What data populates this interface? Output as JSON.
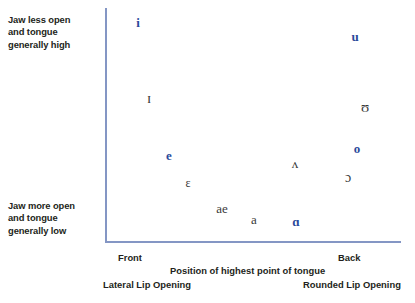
{
  "figure": {
    "accent_color": "#2b4a9b",
    "axis_color": "#8496c4",
    "symbol_color_secondary": "#3a3a3a"
  },
  "notes": {
    "top_left": {
      "line1": "Jaw less open",
      "line2": "and tongue",
      "line3": "generally high"
    },
    "bottom_left": {
      "line1": "Jaw more open",
      "line2": "and tongue",
      "line3": "generally low"
    }
  },
  "axis_labels": {
    "front": "Front",
    "back": "Back",
    "x_title": "Position of highest point of tongue",
    "lateral": "Lateral Lip Opening",
    "rounded": "Rounded Lip Opening"
  },
  "chart_data": {
    "type": "scatter",
    "title": "",
    "xlabel": "Position of highest point of tongue",
    "ylabel": "",
    "xlim": [
      0,
      1
    ],
    "ylim": [
      0,
      1
    ],
    "grid": false,
    "legend": "none",
    "x_tick_labels": [
      "Front",
      "Back"
    ],
    "y_axis_description_high": "Jaw less open and tongue generally high",
    "y_axis_description_low": "Jaw more open and tongue generally low",
    "points": [
      {
        "symbol": "i",
        "x": 0.112,
        "y": 0.94,
        "color": "#2b4a9b",
        "emphasis": "bold",
        "px": 138,
        "py": 22,
        "size": 13
      },
      {
        "symbol": "u",
        "x": 0.846,
        "y": 0.88,
        "color": "#2b4a9b",
        "emphasis": "bold",
        "px": 355,
        "py": 36,
        "size": 13
      },
      {
        "symbol": "ɪ",
        "x": 0.149,
        "y": 0.618,
        "color": "#3a3a3a",
        "emphasis": "normal",
        "px": 149,
        "py": 98,
        "size": 15
      },
      {
        "symbol": "ʊ",
        "x": 0.88,
        "y": 0.58,
        "color": "#3a3a3a",
        "emphasis": "normal",
        "px": 365,
        "py": 107,
        "size": 15
      },
      {
        "symbol": "e",
        "x": 0.217,
        "y": 0.375,
        "color": "#2b4a9b",
        "emphasis": "bold",
        "px": 169,
        "py": 155,
        "size": 13
      },
      {
        "symbol": "o",
        "x": 0.853,
        "y": 0.4,
        "color": "#2b4a9b",
        "emphasis": "bold",
        "px": 357,
        "py": 148,
        "size": 13
      },
      {
        "symbol": "ʌ",
        "x": 0.642,
        "y": 0.335,
        "color": "#3a3a3a",
        "emphasis": "normal",
        "px": 295,
        "py": 163,
        "size": 13
      },
      {
        "symbol": "ɔ",
        "x": 0.821,
        "y": 0.272,
        "color": "#3a3a3a",
        "emphasis": "normal",
        "px": 348,
        "py": 178,
        "size": 14
      },
      {
        "symbol": "ɛ",
        "x": 0.281,
        "y": 0.252,
        "color": "#3a3a3a",
        "emphasis": "normal",
        "px": 188,
        "py": 183,
        "size": 12
      },
      {
        "symbol": "ae",
        "x": 0.395,
        "y": 0.15,
        "color": "#3a3a3a",
        "emphasis": "normal",
        "px": 222,
        "py": 208,
        "size": 13
      },
      {
        "symbol": "a",
        "x": 0.503,
        "y": 0.105,
        "color": "#3a3a3a",
        "emphasis": "normal",
        "px": 254,
        "py": 219,
        "size": 13
      },
      {
        "symbol": "ɑ",
        "x": 0.645,
        "y": 0.095,
        "color": "#2b4a9b",
        "emphasis": "bold",
        "px": 296,
        "py": 221,
        "size": 13
      }
    ]
  }
}
